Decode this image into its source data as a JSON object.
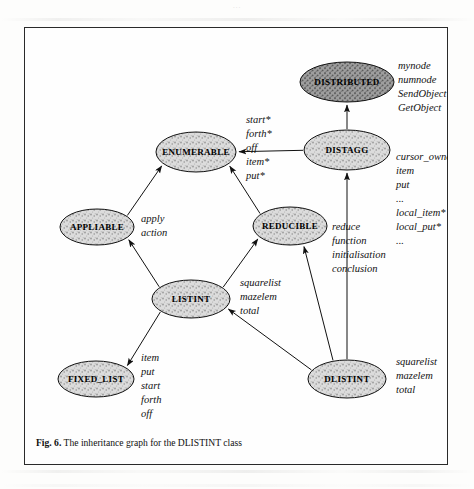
{
  "document": {
    "running_head": "...",
    "caption_prefix": "Fig. 6.",
    "caption_text": "The inheritance graph for the DLISTINT class"
  },
  "figure": {
    "title": "The inheritance graph for the DLISTINT class",
    "type": "inheritance-graph",
    "node_fill": "#d8d8d8",
    "node_stroke": "#111111",
    "edge_color": "#111111"
  },
  "nodes": [
    {
      "id": "distributed",
      "label": "DISTRIBUTED",
      "cx": 323,
      "cy": 55,
      "rx": 47,
      "ry": 20,
      "features": [
        "mynode",
        "numnode",
        "SendObject",
        "GetObject"
      ],
      "features_x": 374,
      "features_y": 42
    },
    {
      "id": "distagg",
      "label": "DISTAGG",
      "cx": 323,
      "cy": 123,
      "rx": 43,
      "ry": 20,
      "features": [
        "cursor_owner",
        "item",
        "put",
        "...",
        "local_item*",
        "local_put*",
        "..."
      ],
      "features_x": 372,
      "features_y": 133
    },
    {
      "id": "enumerable",
      "label": "ENUMERABLE",
      "cx": 172,
      "cy": 125,
      "rx": 40,
      "ry": 20,
      "features": [
        "start*",
        "forth*",
        "off",
        "item*",
        "put*"
      ],
      "features_x": 222,
      "features_y": 96
    },
    {
      "id": "appliable",
      "label": "APPLIABLE",
      "cx": 73,
      "cy": 200,
      "rx": 37,
      "ry": 18,
      "features": [
        "apply",
        "action"
      ],
      "features_x": 117,
      "features_y": 195
    },
    {
      "id": "reducible",
      "label": "REDUCIBLE",
      "cx": 266,
      "cy": 199,
      "rx": 37,
      "ry": 19,
      "features": [
        "reduce",
        "function",
        "initialisation",
        "conclusion"
      ],
      "features_x": 308,
      "features_y": 203
    },
    {
      "id": "listint",
      "label": "LISTINT",
      "cx": 167,
      "cy": 272,
      "rx": 39,
      "ry": 19,
      "features": [
        "squarelist",
        "mazelem",
        "total"
      ],
      "features_x": 216,
      "features_y": 259
    },
    {
      "id": "fixed_list",
      "label": "FIXED_LIST",
      "cx": 72,
      "cy": 352,
      "rx": 38,
      "ry": 18,
      "features": [
        "item",
        "put",
        "start",
        "forth",
        "off"
      ],
      "features_x": 117,
      "features_y": 334
    },
    {
      "id": "dlistint",
      "label": "DLISTINT",
      "cx": 323,
      "cy": 352,
      "rx": 39,
      "ry": 19,
      "features": [
        "squarelist",
        "mazelem",
        "total"
      ],
      "features_x": 372,
      "features_y": 338
    }
  ],
  "edges": [
    {
      "id": "distagg-to-enumerable",
      "from": "distagg",
      "to": "enumerable"
    },
    {
      "id": "distagg-to-distributed",
      "from": "distagg",
      "to": "distributed"
    },
    {
      "id": "appliable-to-enumerable",
      "from": "appliable",
      "to": "enumerable"
    },
    {
      "id": "reducible-to-enumerable",
      "from": "reducible",
      "to": "enumerable"
    },
    {
      "id": "listint-to-appliable",
      "from": "listint",
      "to": "appliable"
    },
    {
      "id": "listint-to-reducible",
      "from": "listint",
      "to": "reducible"
    },
    {
      "id": "dlistint-to-reducible",
      "from": "dlistint",
      "to": "reducible"
    },
    {
      "id": "listint-to-fixed_list",
      "from": "listint",
      "to": "fixed_list"
    },
    {
      "id": "dlistint-to-listint",
      "from": "dlistint",
      "to": "listint"
    },
    {
      "id": "dlistint-to-distagg",
      "from": "dlistint",
      "to": "distagg"
    }
  ]
}
